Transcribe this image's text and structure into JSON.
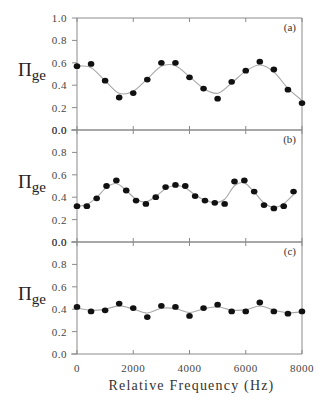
{
  "chart_data": [
    {
      "type": "scatter",
      "panel_label": "(a)",
      "ylabel_main": "Π",
      "ylabel_sub": "ge",
      "xlabel": "Relative Frequency (Hz)",
      "xlim": [
        0,
        8000
      ],
      "ylim": [
        0.0,
        1.0
      ],
      "yticks": [
        "0.0",
        "0.2",
        "0.4",
        "0.6",
        "0.8",
        "1.0"
      ],
      "x": [
        0,
        500,
        1000,
        1500,
        2000,
        2500,
        3000,
        3500,
        4000,
        4500,
        5000,
        5500,
        6000,
        6500,
        7000,
        7500,
        8000
      ],
      "y": [
        0.57,
        0.59,
        0.44,
        0.29,
        0.33,
        0.45,
        0.6,
        0.6,
        0.47,
        0.37,
        0.28,
        0.43,
        0.53,
        0.61,
        0.54,
        0.36,
        0.24
      ],
      "fit_curve": true
    },
    {
      "type": "scatter",
      "panel_label": "(b)",
      "ylabel_main": "Π",
      "ylabel_sub": "ge",
      "xlabel": "Relative Frequency (Hz)",
      "xlim": [
        0,
        8000
      ],
      "ylim": [
        0.0,
        1.0
      ],
      "yticks": [
        "0.0",
        "0.2",
        "0.4",
        "0.6",
        "0.8",
        "0.0"
      ],
      "x": [
        0,
        350,
        700,
        1050,
        1400,
        1750,
        2100,
        2450,
        2800,
        3150,
        3500,
        3850,
        4200,
        4550,
        4900,
        5250,
        5600,
        5950,
        6300,
        6650,
        7000,
        7350,
        7700
      ],
      "y": [
        0.32,
        0.32,
        0.39,
        0.5,
        0.55,
        0.46,
        0.37,
        0.34,
        0.4,
        0.49,
        0.51,
        0.5,
        0.41,
        0.37,
        0.35,
        0.34,
        0.54,
        0.55,
        0.45,
        0.33,
        0.3,
        0.32,
        0.45
      ],
      "fit_curve": true
    },
    {
      "type": "scatter",
      "panel_label": "(c)",
      "ylabel_main": "Π",
      "ylabel_sub": "ge",
      "xlabel": "Relative Frequency (Hz)",
      "xlim": [
        0,
        8000
      ],
      "ylim": [
        0.0,
        1.0
      ],
      "yticks": [
        "0.0",
        "0.2",
        "0.4",
        "0.6",
        "0.8",
        "0.0"
      ],
      "x": [
        0,
        500,
        1000,
        1500,
        2000,
        2500,
        3000,
        3500,
        4000,
        4500,
        5000,
        5500,
        6000,
        6500,
        7000,
        7500,
        8000
      ],
      "y": [
        0.42,
        0.38,
        0.39,
        0.45,
        0.41,
        0.33,
        0.43,
        0.42,
        0.34,
        0.41,
        0.44,
        0.38,
        0.38,
        0.46,
        0.38,
        0.36,
        0.38
      ],
      "fit_curve": true
    }
  ],
  "x_axis": {
    "label": "Relative Frequency (Hz)",
    "ticks": [
      "0",
      "2000",
      "4000",
      "6000",
      "8000"
    ]
  },
  "colors": {
    "axis": "#8a8a8a",
    "points": "#111111",
    "curve": "#a8a8a8",
    "text": "#444444"
  }
}
